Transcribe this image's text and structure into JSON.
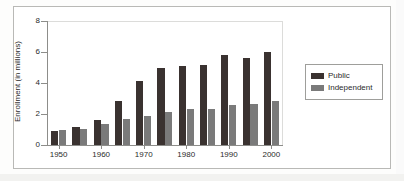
{
  "chart_data": {
    "type": "bar",
    "title": "",
    "subtitle": "",
    "xlabel": "",
    "ylabel": "Enrollment (in millions)",
    "ylim": [
      0,
      8
    ],
    "yticks": [
      0,
      2,
      4,
      6,
      8
    ],
    "ytick_labels": [
      "0",
      "2",
      "4",
      "6",
      "8"
    ],
    "grid": false,
    "legend_position": "right",
    "categories": [
      "1950",
      "1955",
      "1960",
      "1965",
      "1970",
      "1975",
      "1980",
      "1985",
      "1990",
      "1995",
      "2000"
    ],
    "xtick_labels": [
      "1950",
      "1960",
      "1970",
      "1980",
      "1990",
      "2000"
    ],
    "xtick_category_indices": [
      0,
      2,
      4,
      6,
      8,
      10
    ],
    "series": [
      {
        "name": "Public",
        "color": "#3a3230",
        "values": [
          0.9,
          1.15,
          1.6,
          2.85,
          4.15,
          4.95,
          5.1,
          5.15,
          5.8,
          5.6,
          6.0
        ]
      },
      {
        "name": "Independent",
        "color": "#7a7a7a",
        "values": [
          1.0,
          1.05,
          1.35,
          1.7,
          1.9,
          2.1,
          2.3,
          2.35,
          2.6,
          2.65,
          2.85
        ]
      }
    ]
  },
  "legend": {
    "entries": [
      {
        "label": "Public",
        "color": "#3a3230"
      },
      {
        "label": "Independent",
        "color": "#7a7a7a"
      }
    ]
  },
  "colors": {
    "public": "#3a3230",
    "independent": "#7a7a7a",
    "axis": "#8d8d8a",
    "frame": "#b9b9b6",
    "text": "#2b2b2b",
    "background": "#ffffff"
  }
}
